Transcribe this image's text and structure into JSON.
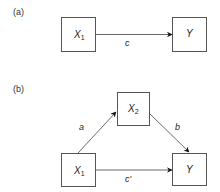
{
  "panels": [
    {
      "label": "(a)",
      "nodes": [
        {
          "id": "X1",
          "var": "X",
          "sub": "1"
        },
        {
          "id": "Y",
          "var": "Y",
          "sub": ""
        }
      ],
      "edges": [
        {
          "from": "X1",
          "to": "Y",
          "label": "c"
        }
      ]
    },
    {
      "label": "(b)",
      "nodes": [
        {
          "id": "X1",
          "var": "X",
          "sub": "1"
        },
        {
          "id": "X2",
          "var": "X",
          "sub": "2"
        },
        {
          "id": "Y",
          "var": "Y",
          "sub": ""
        }
      ],
      "edges": [
        {
          "from": "X1",
          "to": "X2",
          "label": "a"
        },
        {
          "from": "X2",
          "to": "Y",
          "label": "b"
        },
        {
          "from": "X1",
          "to": "Y",
          "label": "c'"
        }
      ]
    }
  ],
  "colors": {
    "stroke": "#444444",
    "arrow": "#111111",
    "text": "#222222"
  }
}
